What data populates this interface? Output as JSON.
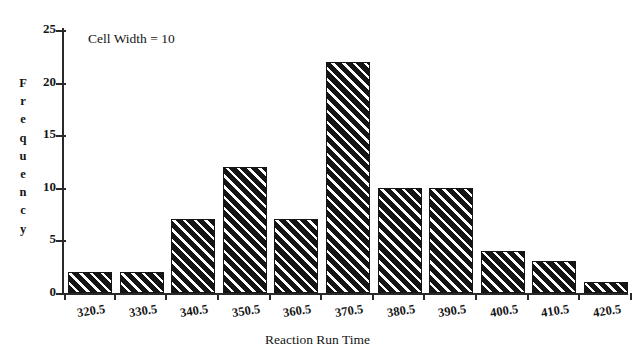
{
  "chart_data": {
    "type": "bar",
    "title": "",
    "subtitle": "",
    "xlabel": "Reaction Run Time",
    "ylabel": "Frequency",
    "categories": [
      "320.5",
      "330.5",
      "340.5",
      "350.5",
      "360.5",
      "370.5",
      "380.5",
      "390.5",
      "400.5",
      "410.5",
      "420.5"
    ],
    "values": [
      2,
      2,
      7,
      12,
      7,
      22,
      10,
      10,
      4,
      3,
      1
    ],
    "ylim": [
      0,
      25
    ],
    "yticks": [
      0,
      5,
      10,
      15,
      20,
      25
    ],
    "ytick_labels": [
      "0",
      "5",
      "10",
      "15",
      "20",
      "25"
    ],
    "grid": false,
    "legend": null,
    "annotations": [
      {
        "text": "Cell Width = 10",
        "position": "top-left"
      }
    ],
    "bar_style": {
      "fill": "diagonal-hatch",
      "hatch_angle_deg": 45,
      "edge_color": "#151515",
      "face_color": "#ffffff"
    }
  },
  "colors": {
    "background": "#ffffff",
    "ink": "#151515",
    "axis": "#2a2a2a"
  }
}
